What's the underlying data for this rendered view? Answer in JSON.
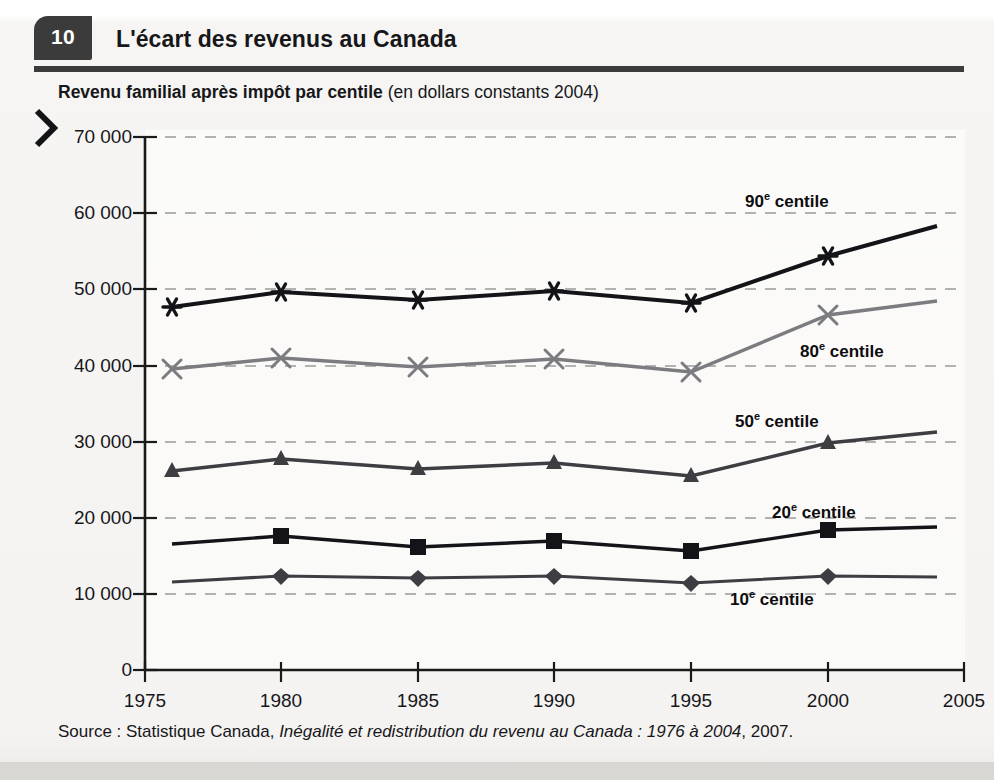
{
  "header": {
    "number": "10",
    "title": "L'écart des revenus au Canada"
  },
  "subtitle": {
    "bold": "Revenu familial après impôt par centile",
    "light": " (en dollars constants 2004)"
  },
  "source": {
    "prefix": "Source : Statistique Canada, ",
    "italic": "Inégalité et redistribution du revenu au Canada : 1976 à 2004",
    "suffix": ", 2007."
  },
  "colors": {
    "ink": "#17171a",
    "header_bar": "#3b3b3b",
    "dark_series": "#141418",
    "mid_series": "#3d3d42",
    "light_series": "#7c7c80",
    "gridline": "#9a9a9a",
    "axis": "#1a1a1a",
    "paper": "#f4f3f1"
  },
  "chart_data": {
    "type": "line",
    "title": "Revenu familial après impôt par centile (en dollars constants 2004)",
    "xlabel": "",
    "ylabel": "",
    "xlim": [
      1975,
      2005
    ],
    "ylim": [
      0,
      70000
    ],
    "xticks": [
      "1975",
      "1980",
      "1985",
      "1990",
      "1995",
      "2000",
      "2005"
    ],
    "yticks": [
      "0",
      "10 000",
      "20 000",
      "30 000",
      "40 000",
      "50 000",
      "60 000",
      "70 000"
    ],
    "ytick_values": [
      0,
      10000,
      20000,
      30000,
      40000,
      50000,
      60000,
      70000
    ],
    "grid": "horizontal-dashed",
    "legend": "inline-annotations",
    "x": [
      1976,
      1980,
      1985,
      1990,
      1995,
      2000,
      2004
    ],
    "series": [
      {
        "name": "90e centile",
        "label_html": "90<sup>e</sup> centile",
        "marker": "asterisk",
        "color": "#141418",
        "values": [
          47700,
          49700,
          48700,
          49800,
          48200,
          54400,
          58300
        ]
      },
      {
        "name": "80e centile",
        "label_html": "80<sup>e</sup> centile",
        "marker": "x-cross",
        "color": "#7c7c80",
        "values": [
          39600,
          41000,
          39800,
          40900,
          39100,
          46600,
          48400
        ]
      },
      {
        "name": "50e centile",
        "label_html": "50<sup>e</sup> centile",
        "marker": "triangle",
        "color": "#3d3d42",
        "values": [
          26100,
          27700,
          26400,
          27200,
          25500,
          29800,
          31300
        ]
      },
      {
        "name": "20e centile",
        "label_html": "20<sup>e</sup> centile",
        "marker": "square",
        "color": "#141418",
        "values": [
          16500,
          17600,
          16200,
          16900,
          15700,
          18400,
          18800
        ]
      },
      {
        "name": "10e centile",
        "label_html": "10<sup>e</sup> centile",
        "marker": "diamond",
        "color": "#3d3d42",
        "values": [
          11600,
          12400,
          12100,
          12300,
          11400,
          12400,
          12300
        ]
      }
    ],
    "annotations": [
      {
        "text": "90e centile",
        "x": 2000,
        "y": 62000
      },
      {
        "text": "80e centile",
        "x": 2001,
        "y": 42500
      },
      {
        "text": "50e centile",
        "x": 2000,
        "y": 33500
      },
      {
        "text": "20e centile",
        "x": 2001,
        "y": 21500
      },
      {
        "text": "10e centile",
        "x": 2000,
        "y": 9200
      }
    ]
  }
}
